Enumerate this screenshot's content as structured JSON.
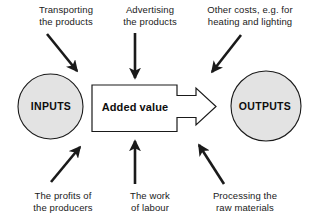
{
  "diagram": {
    "colors": {
      "circle_fill": "#e3e3e3",
      "stroke": "#1a1a1a",
      "text": "#1a1a1a",
      "background": "#ffffff"
    },
    "nodes": {
      "input_circle": {
        "label": "INPUTS"
      },
      "process_box": {
        "label": "Added value"
      },
      "output_circle": {
        "label": "OUTPUTS"
      }
    },
    "captions": {
      "top_left": "Transporting\nthe products",
      "top_middle": "Advertising\nthe products",
      "top_right": "Other costs, e.g. for\nheating and lighting",
      "bottom_left": "The profits of\nthe producers",
      "bottom_middle": "The work\nof labour",
      "bottom_right": "Processing the\nraw materials"
    },
    "arrows": {
      "top_left": "arrow-down-right-icon",
      "top_middle": "arrow-down-icon",
      "top_right": "arrow-down-left-icon",
      "bottom_left": "arrow-up-right-icon",
      "bottom_middle": "arrow-up-icon",
      "bottom_right": "arrow-up-left-icon",
      "process_to_output": "block-arrow-right-icon"
    }
  }
}
